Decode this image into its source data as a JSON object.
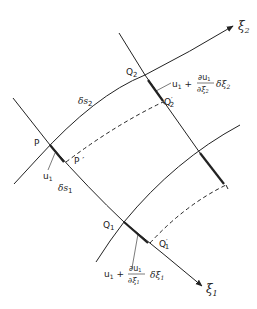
{
  "diagram": {
    "axes": {
      "xi1": {
        "symbol": "ξ",
        "sub": "1"
      },
      "xi2": {
        "symbol": "ξ",
        "sub": "2"
      }
    },
    "points": {
      "P": "P",
      "P_prime": "P ′",
      "Q1": "Q",
      "Q1_sub": "1",
      "Q1_prime": "Q",
      "Q1_prime_sub": "1",
      "Q1_prime_mark": "′",
      "Q2": "Q",
      "Q2_sub": "2",
      "Q2_prime": "Q",
      "Q2_prime_sub": "2",
      "Q2_prime_mark": "′"
    },
    "arc_lengths": {
      "ds1": "δs",
      "ds1_sub": "1",
      "ds2": "δs",
      "ds2_sub": "2"
    },
    "displacements": {
      "u1_at_P": "u",
      "u1_at_P_sub": "1",
      "u1_at_Q2": {
        "base": "u",
        "base_sub": "1",
        "plus": "+",
        "num": "∂u",
        "num_sub": "1",
        "den": "∂ξ",
        "den_sub": "2",
        "tail": "δξ",
        "tail_sub": "2"
      },
      "u1_at_Q1": {
        "base": "u",
        "base_sub": "1",
        "plus": "+",
        "num": "∂u",
        "num_sub": "1",
        "den": "∂ξ",
        "den_sub": "1",
        "tail": "δξ",
        "tail_sub": "1"
      }
    },
    "colors": {
      "line": "#222222",
      "background": "#ffffff"
    }
  }
}
